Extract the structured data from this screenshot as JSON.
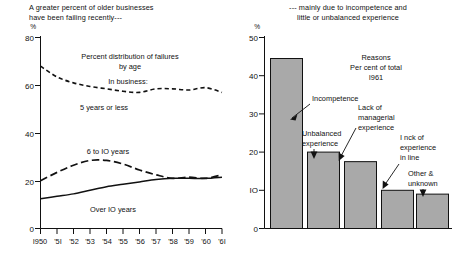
{
  "left_panel": {
    "caption": "A greater percent of older businesses\nhave been failing recently---",
    "pct_symbol": "%",
    "inner_title_line1": "Percent distribution of failures",
    "inner_title_line2": "by age",
    "inner_subtitle": "In business:",
    "label_series1": "5 years or less",
    "label_series2": "6 to IO years",
    "label_series3": "Over IO years"
  },
  "right_panel": {
    "caption": "--- mainly due to incompetence and\nlittle or unbalanced experience",
    "pct_symbol": "%",
    "inner_title_line1": "Reasons",
    "inner_title_line2": "Per cent of total",
    "inner_title_line3": "I961",
    "anno1": "Incompetence",
    "anno2_line1": "Unbalanced",
    "anno2_line2": "experience",
    "anno3_line1": "Lack of",
    "anno3_line2": "managerial",
    "anno3_line3": "experience",
    "anno4_line1": "I nck of",
    "anno4_line2": "experience",
    "anno4_line3": "in line",
    "anno5_line1": "Other &",
    "anno5_line2": "unknown"
  },
  "chart_data": [
    {
      "id": "left",
      "type": "line",
      "title": "Percent distribution of failures by age",
      "xlabel": "",
      "ylabel": "%",
      "ylim": [
        0,
        80
      ],
      "yticks": [
        0,
        20,
        40,
        60,
        80
      ],
      "ytick_labels": [
        "0",
        "20",
        "40",
        "60",
        "80"
      ],
      "x": [
        1950,
        1951,
        1952,
        1953,
        1954,
        1955,
        1956,
        1957,
        1958,
        1959,
        1960,
        1961
      ],
      "xtick_labels": [
        "I950",
        "'5I",
        "'52",
        "'53",
        "'54",
        "'55",
        "'56",
        "'57",
        "'58",
        "'59",
        "'60",
        "'6I"
      ],
      "grid": false,
      "legend": "inline-labels",
      "series": [
        {
          "name": "5 years or less",
          "style": "dashed-short",
          "values": [
            68.0,
            63.5,
            61.0,
            59.5,
            58.5,
            57.5,
            57.0,
            58.5,
            58.5,
            58.0,
            59.0,
            57.0
          ]
        },
        {
          "name": "6 to IO years",
          "style": "dashed-long",
          "values": [
            20.0,
            23.5,
            26.5,
            28.5,
            28.5,
            27.0,
            24.5,
            22.5,
            21.0,
            21.5,
            21.0,
            22.5
          ]
        },
        {
          "name": "Over IO years",
          "style": "solid",
          "values": [
            12.5,
            13.5,
            14.5,
            16.0,
            17.5,
            18.5,
            19.5,
            20.5,
            21.0,
            21.0,
            21.0,
            21.5
          ]
        }
      ]
    },
    {
      "id": "right",
      "type": "bar",
      "title": "Reasons Per cent of total I961",
      "xlabel": "",
      "ylabel": "%",
      "ylim": [
        0,
        50
      ],
      "yticks": [
        0,
        10,
        20,
        30,
        40,
        50
      ],
      "ytick_labels": [
        "0",
        "IO",
        "20",
        "30",
        "40",
        "50"
      ],
      "grid": false,
      "categories": [
        "Incompetence",
        "Unbalanced experience",
        "Lack of managerial experience",
        "Lack of experience in line",
        "Other & unknown"
      ],
      "values": [
        44.5,
        20.0,
        17.5,
        10.0,
        9.0
      ]
    }
  ]
}
